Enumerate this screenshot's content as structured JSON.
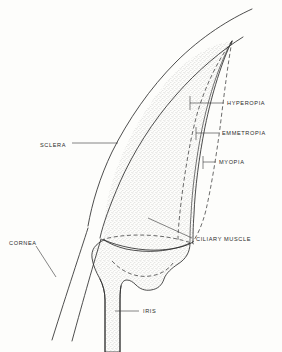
{
  "figure": {
    "background_color": "#fdfdfb",
    "ink_color": "#2e2e2e"
  },
  "labels": [
    {
      "id": "sclera",
      "text": "SCLERA",
      "text_x": 40,
      "text_y": 145,
      "anchor": "start",
      "leader": "M 72 143 L 118 143",
      "tick": "",
      "curve_type": "solid",
      "side": "left"
    },
    {
      "id": "cornea",
      "text": "CORNEA",
      "text_x": 9,
      "text_y": 243,
      "anchor": "start",
      "leader": "M 36 246 L 56 277",
      "tick": "",
      "curve_type": "solid",
      "side": "left"
    },
    {
      "id": "iris",
      "text": "IRIS",
      "text_x": 143,
      "text_y": 313,
      "anchor": "start",
      "leader": "M 115 311 L 139 311",
      "tick": "",
      "curve_type": "solid",
      "side": "bottom"
    },
    {
      "id": "hyperopia",
      "text": "HYPEROPIA",
      "text_x": 227,
      "text_y": 105,
      "anchor": "start",
      "leader": "M 190 103 L 224 103",
      "tick": "M 190 96 L 190 110",
      "curve_type": "dashed-inner",
      "side": "right"
    },
    {
      "id": "emmetropia",
      "text": "EMMETROPIA",
      "text_x": 222,
      "text_y": 135,
      "anchor": "start",
      "leader": "M 196 133 L 219 133",
      "tick": "M 196 127 L 196 140",
      "curve_type": "solid-lens",
      "side": "right"
    },
    {
      "id": "myopia",
      "text": "MYOPIA",
      "text_x": 219,
      "text_y": 164,
      "anchor": "start",
      "leader": "M 203 162 L 216 162",
      "tick": "M 203 156 L 203 169",
      "curve_type": "dashed-outer",
      "side": "right"
    },
    {
      "id": "ciliary-muscle",
      "text": "CILIARY MUSCLE",
      "text_x": 196,
      "text_y": 239,
      "anchor": "start",
      "leader": "M 148 218 L 192 238",
      "tick": "",
      "curve_type": "solid",
      "side": "right"
    }
  ],
  "anatomy": {
    "sclera_outer": "M 252 9 C 230 19 202 36 176 62 C 150 88 128 120 112 152 C 100 177 92 203 88 226",
    "sclera_inner": "M 243 37 C 222 50 198 70 176 95 C 152 122 133 153 120 182 C 110 205 103 224 100 238",
    "cornea_outer": "M 88 228 C 80 253 68 289 52 340",
    "cornea_inner": "M 101 239 C 94 262 84 297 72 341",
    "lens_solid": "M 232 41 C 222 61 212 93 205 127 C 199 157 195 189 194 214 C 193 228 193 236 193 242",
    "lens_solid_inner": "M 232 41 C 220 62 209 95 202 129 C 196 159 192 191 191 215 C 190 229 190 237 190 243",
    "hyperopia_dash": "M 232 41 C 218 60 204 88 196 118 C 189 145 184 178 181 203 C 179 220 178 232 178 240",
    "myopia_dash": "M 232 41 C 228 63 224 95 220 128 C 216 158 211 188 206 210 C 202 226 197 236 192 243",
    "vitreous_body": "M 232 41 C 222 61 212 93 205 127 C 199 157 195 189 194 214 C 193 228 193 236 193 242 C 180 250 160 252 142 250 C 126 248 114 244 104 240 C 103 222 106 200 114 176 C 124 146 142 112 164 85 C 186 58 210 44 232 41 Z",
    "ciliary_top_line": "M 104 240 C 120 247 142 251 160 250 C 176 249 187 246 193 242",
    "ciliary_dash_line": "M 101 240 C 120 234 146 234 166 237 C 180 239 189 242 194 244",
    "ciliary_body": "M 104 240 C 110 244 118 247 126 249 C 136 251 148 252 158 251 C 170 250 182 247 190 243 C 190 252 186 259 178 264 C 172 268 166 273 164 279 C 162 285 158 289 151 290 C 145 291 140 289 136 285 C 133 282 130 280 127 280 C 124 280 122 282 121 286 C 120 291 120 297 120 304 L 120 352 L 105 352 L 105 300 C 105 292 103 285 100 279 C 96 272 93 265 92 258 C 91 250 95 244 104 240 Z",
    "ciliary_inner_dash": "M 112 261 C 122 272 136 278 150 276 C 160 275 168 270 173 263",
    "iris_stalk_left": "M 105 352 L 105 300 C 105 292 103 285 100 279",
    "iris_stalk_right": "M 120 352 L 120 304 C 120 297 120 291 121 286"
  }
}
